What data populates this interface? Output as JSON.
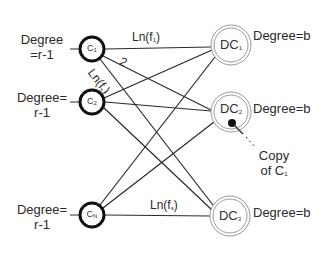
{
  "diagram": {
    "type": "bipartite-graph",
    "left_nodes": [
      {
        "id": "C1",
        "label": "C",
        "sub": "1",
        "degree_label": "Degree\n=r-1",
        "x": 92,
        "y": 49
      },
      {
        "id": "C2",
        "label": "C",
        "sub": "2",
        "degree_label": "Degree=\nr-1",
        "x": 92,
        "y": 102
      },
      {
        "id": "CN",
        "label": "C",
        "sub": "N",
        "degree_label": "Degree=\nr-1",
        "x": 92,
        "y": 215
      }
    ],
    "right_nodes": [
      {
        "id": "DC1",
        "label": "DC",
        "sub": "1",
        "degree_label": "Degree=b",
        "x": 231,
        "y": 45
      },
      {
        "id": "DC2",
        "label": "DC",
        "sub": "2",
        "degree_label": "Degree=b",
        "x": 231,
        "y": 112
      },
      {
        "id": "DC3",
        "label": "DC",
        "sub": "3",
        "degree_label": "Degree=b",
        "x": 230,
        "y": 216
      }
    ],
    "edges": [
      {
        "from": "C1",
        "to": "DC1",
        "label": "Ln(f1)"
      },
      {
        "from": "C1",
        "to": "DC2",
        "label": "2"
      },
      {
        "from": "C1",
        "to": "DC3",
        "label": "Ln(fs)"
      },
      {
        "from": "C2",
        "to": "DC1"
      },
      {
        "from": "C2",
        "to": "DC2"
      },
      {
        "from": "C2",
        "to": "DC3"
      },
      {
        "from": "CN",
        "to": "DC1"
      },
      {
        "from": "CN",
        "to": "DC2"
      },
      {
        "from": "CN",
        "to": "DC3",
        "label": "Ln(fs)"
      }
    ],
    "annotation": {
      "text_line1": "Copy",
      "text_line2": "of C",
      "sub": "1",
      "target": "DC2"
    }
  },
  "labels": {
    "c1_degree_line1": "Degree",
    "c1_degree_line2": "=r-1",
    "c2_degree_line1": "Degree=",
    "c2_degree_line2": "r-1",
    "cn_degree_line1": "Degree=",
    "cn_degree_line2": "r-1",
    "dc1_degree": "Degree=b",
    "dc2_degree": "Degree=b",
    "dc3_degree": "Degree=b",
    "c1_main": "C",
    "c1_sub": "1",
    "c2_main": "C",
    "c2_sub": "2",
    "cn_main": "C",
    "cn_sub": "N",
    "dc1_main": "DC",
    "dc1_sub": "1",
    "dc2_main": "DC",
    "dc2_sub": "2",
    "dc3_main": "DC",
    "dc3_sub": "3",
    "edge_top_main": "Ln(f",
    "edge_top_sub": "1",
    "edge_top_close": ")",
    "edge_diag_2": "2",
    "edge_diag_ln": "Ln(f",
    "edge_diag_sub": "s",
    "edge_diag_close": ")",
    "edge_bottom_main": "Ln(f",
    "edge_bottom_sub": "s",
    "edge_bottom_close": ")",
    "copy_line1": "Copy",
    "copy_line2": "of C",
    "copy_sub": "1"
  },
  "colors": {
    "stroke": "#2a2a2a",
    "dc_ring": "#9a9a9a",
    "text": "#2a2a2a"
  }
}
